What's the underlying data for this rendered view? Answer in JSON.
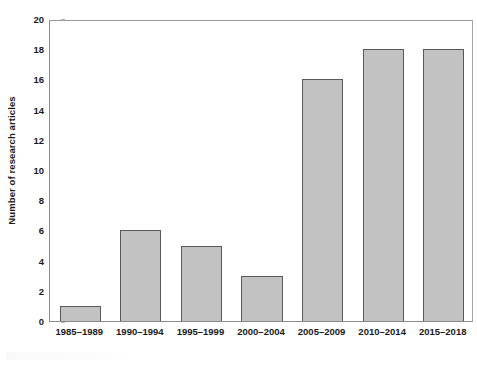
{
  "chart_data": {
    "type": "bar",
    "title": "",
    "subtitle": "",
    "xlabel": "",
    "ylabel": "Number of research articles",
    "categories": [
      "1985–1989",
      "1990–1994",
      "1995–1999",
      "2000–2004",
      "2005–2009",
      "2010–2014",
      "2015–2018"
    ],
    "values": [
      1,
      6,
      5,
      3,
      16,
      18,
      18
    ],
    "ylim": [
      0,
      20
    ],
    "ytick_values": [
      0,
      2,
      4,
      6,
      8,
      10,
      12,
      14,
      16,
      18,
      20
    ],
    "ytick_labels": [
      "0",
      "2",
      "4",
      "6",
      "8",
      "10",
      "12",
      "14",
      "16",
      "18",
      "20"
    ],
    "grid": false,
    "legend": false,
    "legend_position": "none",
    "annotations": []
  },
  "style": {
    "bar_fill": "#c2c2c2",
    "bar_edge": "#595959",
    "axis_color": "#8a8a8a",
    "tick_color": "#6e6e6e",
    "text_color": "#1a1a1a",
    "background": "#ffffff"
  }
}
